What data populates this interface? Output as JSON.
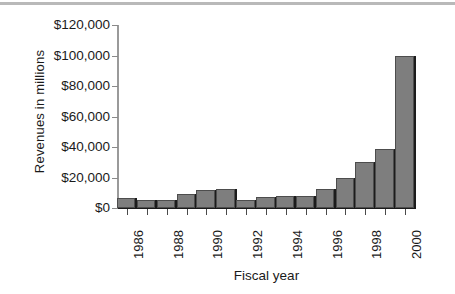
{
  "chart_data": {
    "type": "bar",
    "title": "",
    "xlabel": "Fiscal year",
    "ylabel": "Revenues in millions",
    "ylim": [
      0,
      120000
    ],
    "yticks": [
      0,
      20000,
      40000,
      60000,
      80000,
      100000,
      120000
    ],
    "ytick_labels": [
      "$0",
      "$20,000",
      "$40,000",
      "$60,000",
      "$80,000",
      "$100,000",
      "$120,000"
    ],
    "xtick_labels": [
      "1986",
      "",
      "1988",
      "",
      "1990",
      "",
      "1992",
      "",
      "1994",
      "",
      "1996",
      "",
      "1998",
      "",
      "2000"
    ],
    "categories": [
      "1986",
      "1987",
      "1988",
      "1989",
      "1990",
      "1991",
      "1992",
      "1993",
      "1994",
      "1995",
      "1996",
      "1997",
      "1998",
      "1999",
      "2000"
    ],
    "values": [
      6500,
      5500,
      5000,
      9500,
      12000,
      12500,
      5500,
      7000,
      8000,
      8000,
      12500,
      19500,
      30000,
      38500,
      100000
    ],
    "grid": false,
    "legend": "none",
    "bar_color": "#7e7e7e",
    "bar_edge_color": "#4d4d4d",
    "bar_shadow_color": "#1c1c1c",
    "axis_color": "#1a1a1a"
  },
  "axes": {
    "y_title": "Revenues in millions",
    "x_title": "Fiscal year"
  }
}
